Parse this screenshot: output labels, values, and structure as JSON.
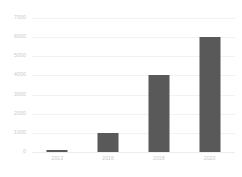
{
  "chart_data": {
    "type": "bar",
    "title": "",
    "subtitle": "",
    "xlabel": "",
    "ylabel": "",
    "categories": [
      "2013",
      "2016",
      "2018",
      "2020"
    ],
    "values": [
      120,
      1000,
      4000,
      6000
    ],
    "series": [
      {
        "name": "",
        "values": [
          120,
          1000,
          4000,
          6000
        ]
      }
    ],
    "ylim": [
      0,
      7000
    ],
    "yticks": [
      0,
      1000,
      2000,
      3000,
      4000,
      5000,
      6000,
      7000
    ],
    "ytick_labels": [
      "0",
      "1000",
      "2000",
      "3000",
      "4000",
      "5000",
      "6000",
      "7000"
    ],
    "grid": true,
    "grid_axis": "y",
    "legend": false,
    "legend_position": "none",
    "bar_color": "#595959",
    "grid_color": "#f2f2f2",
    "tick_label_color": "#c9c9c9",
    "background_color": "#ffffff"
  }
}
